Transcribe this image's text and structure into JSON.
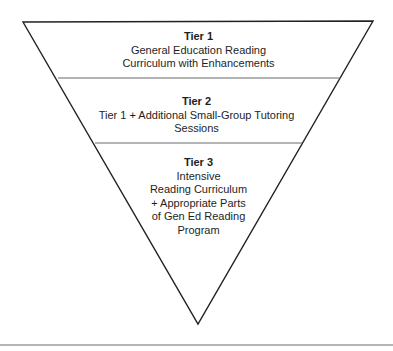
{
  "diagram": {
    "type": "inverted-pyramid",
    "line_color": "#222222",
    "divider_color": "#6a6a6a",
    "text_color": "#1e1e1e",
    "tiers": [
      {
        "title": "Tier 1",
        "lines": [
          "General Education Reading",
          "Curriculum with Enhancements"
        ]
      },
      {
        "title": "Tier 2",
        "lines": [
          "Tier 1 + Additional Small-Group Tutoring",
          "Sessions"
        ]
      },
      {
        "title": "Tier 3",
        "lines": [
          "Intensive",
          "Reading Curriculum",
          "+ Appropriate Parts",
          "of Gen Ed Reading",
          "Program"
        ]
      }
    ]
  }
}
